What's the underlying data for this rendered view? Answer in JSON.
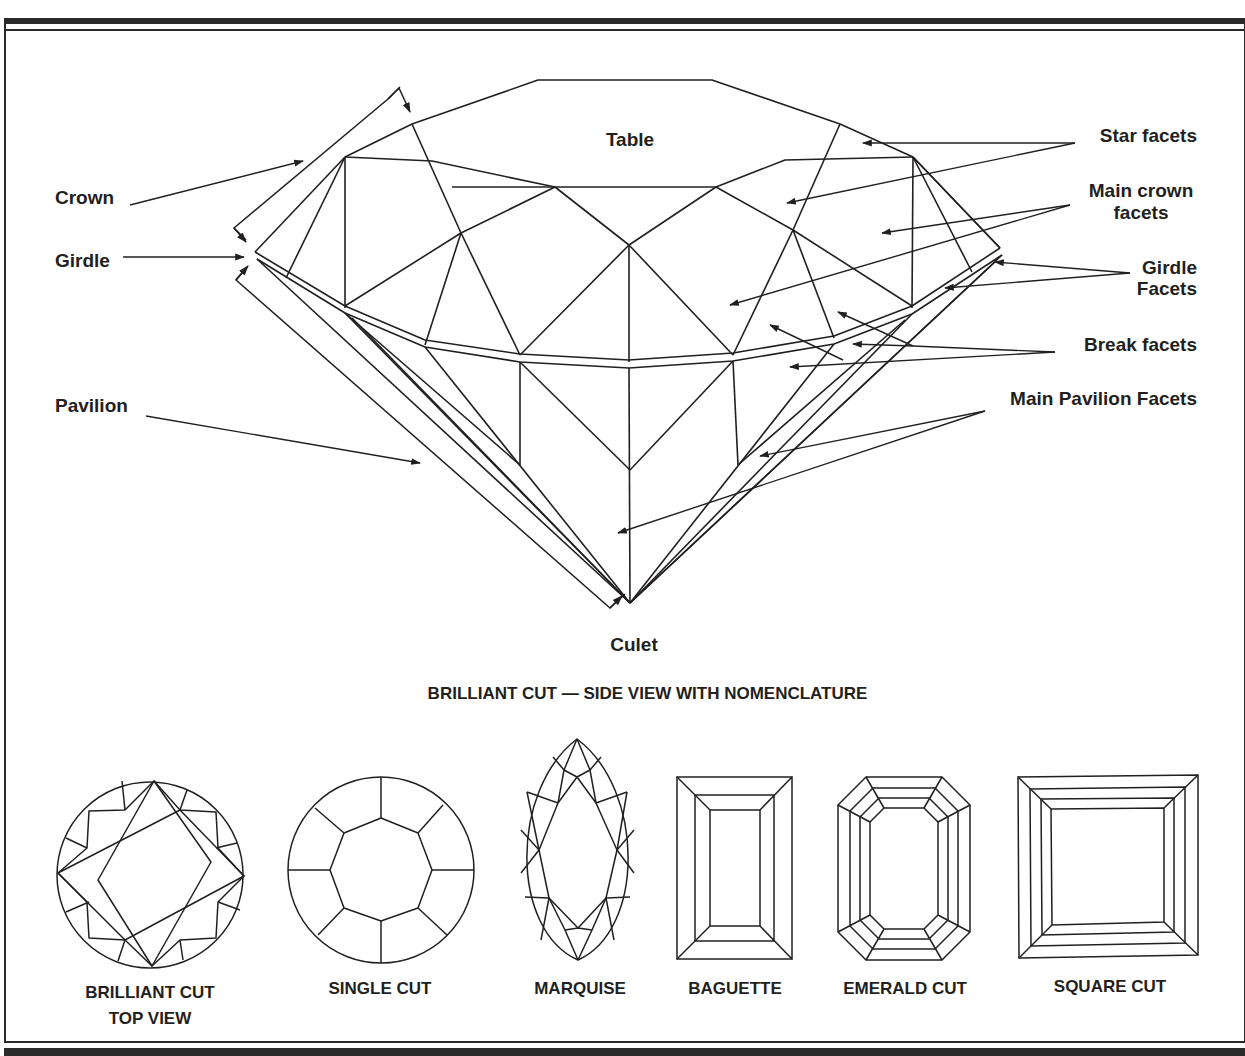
{
  "figure": {
    "type": "gemstone cut nomenclature diagram",
    "stroke_color": "#231f20",
    "background_color": "#ffffff"
  },
  "side_view": {
    "caption": "BRILLIANT CUT — SIDE VIEW WITH NOMENCLATURE",
    "labels": {
      "table": "Table",
      "crown": "Crown",
      "girdle": "Girdle",
      "pavilion": "Pavilion",
      "culet": "Culet",
      "star_facets": "Star facets",
      "main_crown_facets_line1": "Main crown",
      "main_crown_facets_line2": "facets",
      "girdle_facets_line1": "Girdle",
      "girdle_facets_line2": "Facets",
      "break_facets": "Break facets",
      "main_pavilion_facets": "Main Pavilion Facets"
    }
  },
  "cuts": [
    {
      "name": "brilliant-cut-top-view",
      "label_line1": "BRILLIANT CUT",
      "label_line2": "TOP VIEW"
    },
    {
      "name": "single-cut",
      "label_line1": "SINGLE CUT"
    },
    {
      "name": "marquise",
      "label_line1": "MARQUISE"
    },
    {
      "name": "baguette",
      "label_line1": "BAGUETTE"
    },
    {
      "name": "emerald-cut",
      "label_line1": "EMERALD CUT"
    },
    {
      "name": "square-cut",
      "label_line1": "SQUARE CUT"
    }
  ]
}
